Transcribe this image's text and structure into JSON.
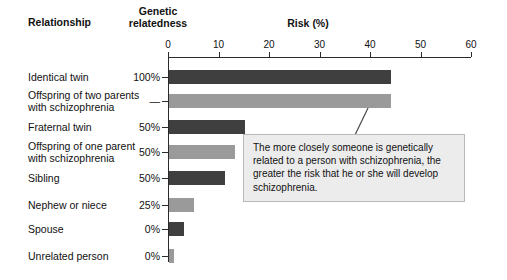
{
  "headers": {
    "relationship": "Relationship",
    "relatedness_line1": "Genetic",
    "relatedness_line2": "relatedness",
    "risk": "Risk (%)"
  },
  "callout": {
    "text": "The more closely someone is genetically related to a person with schizophrenia, the greater the risk that he or she will develop schizophrenia."
  },
  "colors": {
    "bar_dark": "#3f3f3f",
    "bar_light": "#9a9a9a",
    "axis": "#2b2b2b",
    "callout_bg": "#ececed",
    "callout_border": "#b9b9bb"
  },
  "chart_data": {
    "type": "bar",
    "orientation": "horizontal",
    "title": "Risk (%)",
    "xlabel": "Risk (%)",
    "ylabel": "Relationship",
    "xlim": [
      0,
      60
    ],
    "xticks": [
      0,
      10,
      20,
      30,
      40,
      50,
      60
    ],
    "grid": false,
    "legend": "none",
    "categories": [
      "Identical twin",
      "Offspring of two parents with schizophrenia",
      "Fraternal twin",
      "Offspring of one parent with schizophrenia",
      "Sibling",
      "Nephew or niece",
      "Spouse",
      "Unrelated person"
    ],
    "values": [
      44,
      44,
      15,
      13,
      11,
      5,
      3,
      1
    ],
    "genetic_relatedness": [
      "100%",
      "—",
      "50%",
      "50%",
      "50%",
      "25%",
      "0%",
      "0%"
    ],
    "bar_shades": [
      "dark",
      "light",
      "dark",
      "light",
      "dark",
      "light",
      "dark",
      "light"
    ],
    "annotations": [
      "The more closely someone is genetically related to a person with schizophrenia, the greater the risk that he or she will develop schizophrenia."
    ]
  },
  "rows": [
    {
      "label_line1": "Identical twin",
      "label_line2": "",
      "relatedness": "100%",
      "value": 44,
      "shade": "dark",
      "top": 64
    },
    {
      "label_line1": "Offspring of two parents",
      "label_line2": "with schizophrenia",
      "relatedness": "—",
      "value": 44,
      "shade": "light",
      "top": 88
    },
    {
      "label_line1": "Fraternal twin",
      "label_line2": "",
      "relatedness": "50%",
      "value": 15,
      "shade": "dark",
      "top": 114
    },
    {
      "label_line1": "Offspring of one parent",
      "label_line2": "with schizophrenia",
      "relatedness": "50%",
      "value": 13,
      "shade": "light",
      "top": 139
    },
    {
      "label_line1": "Sibling",
      "label_line2": "",
      "relatedness": "50%",
      "value": 11,
      "shade": "dark",
      "top": 165
    },
    {
      "label_line1": "Nephew or niece",
      "label_line2": "",
      "relatedness": "25%",
      "value": 5,
      "shade": "light",
      "top": 192
    },
    {
      "label_line1": "Spouse",
      "label_line2": "",
      "relatedness": "0%",
      "value": 3,
      "shade": "dark",
      "top": 216
    },
    {
      "label_line1": "Unrelated person",
      "label_line2": "",
      "relatedness": "0%",
      "value": 1,
      "shade": "light",
      "top": 243
    }
  ]
}
